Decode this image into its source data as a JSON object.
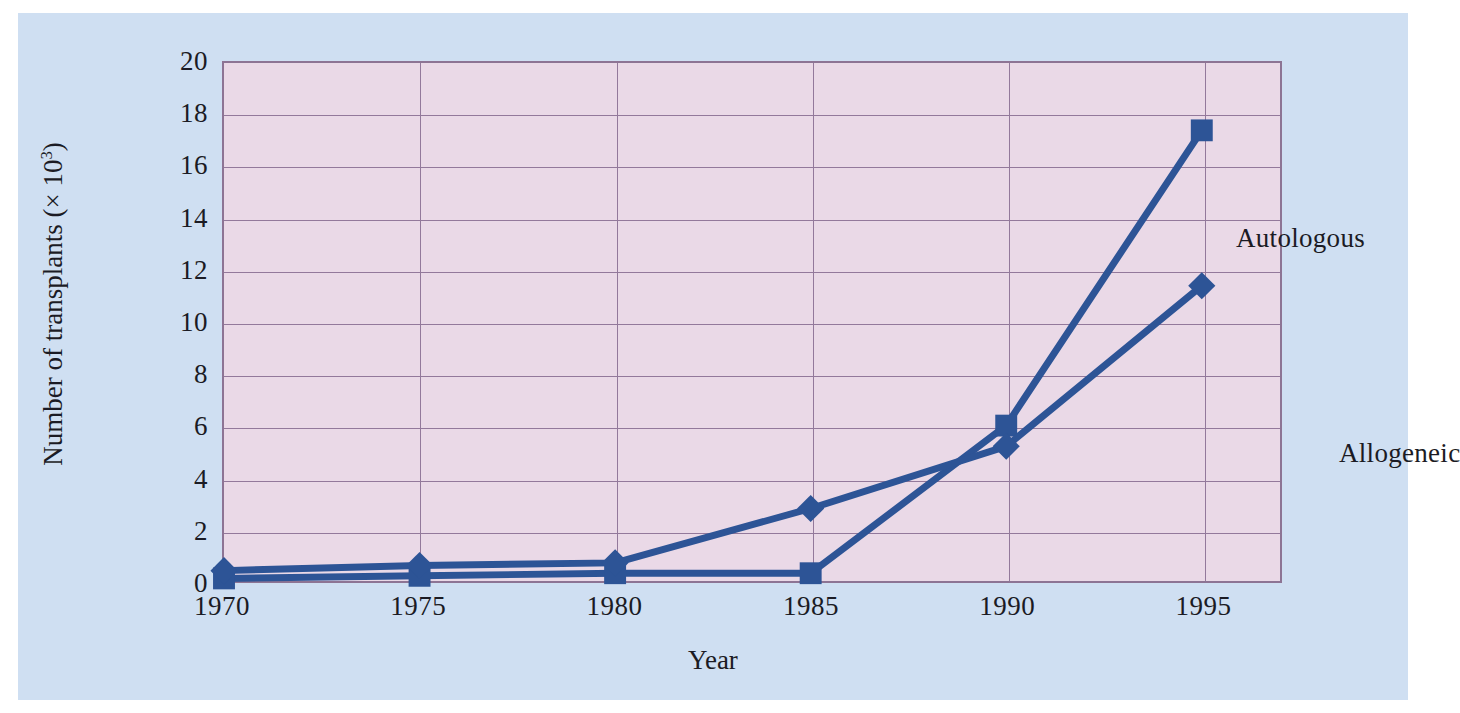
{
  "figure": {
    "background_color": "#cfdff2",
    "plot_background_color": "#ead9e7",
    "grid_color": "#93799b",
    "series_color": "#2d5496"
  },
  "chart_data": {
    "type": "line",
    "title": "",
    "xlabel": "Year",
    "ylabel": "Number of transplants (× 10³)",
    "ylabel_prefix": "Number of transplants (× 10",
    "ylabel_exponent": "3",
    "ylabel_suffix": ")",
    "x": [
      1970,
      1975,
      1980,
      1985,
      1990,
      1995
    ],
    "categories": [
      "1970",
      "1975",
      "1980",
      "1985",
      "1990",
      "1995"
    ],
    "xlim": [
      1970,
      1997
    ],
    "ylim": [
      0,
      20
    ],
    "yticks": [
      0,
      2,
      4,
      6,
      8,
      10,
      12,
      14,
      16,
      18,
      20
    ],
    "ytick_labels": [
      "0",
      "2",
      "4",
      "6",
      "8",
      "10",
      "12",
      "14",
      "16",
      "18",
      "20"
    ],
    "xticks": [
      1970,
      1975,
      1980,
      1985,
      1990,
      1995
    ],
    "xtick_labels": [
      "1970",
      "1975",
      "1980",
      "1985",
      "1990",
      "1995"
    ],
    "grid": true,
    "legend": "annotations-on-plot",
    "series": [
      {
        "name": "Autologous",
        "marker": "square",
        "color": "#2d5496",
        "values": [
          0.1,
          0.2,
          0.3,
          0.3,
          6.0,
          17.4
        ]
      },
      {
        "name": "Allogeneic",
        "marker": "diamond",
        "color": "#2d5496",
        "values": [
          0.4,
          0.6,
          0.7,
          2.8,
          5.2,
          11.4
        ]
      }
    ],
    "annotations": [
      {
        "text": "Autologous",
        "x": 1991.2,
        "y": 15.1
      },
      {
        "text": "Allogeneic",
        "x": 1993.8,
        "y": 6.9
      }
    ]
  }
}
